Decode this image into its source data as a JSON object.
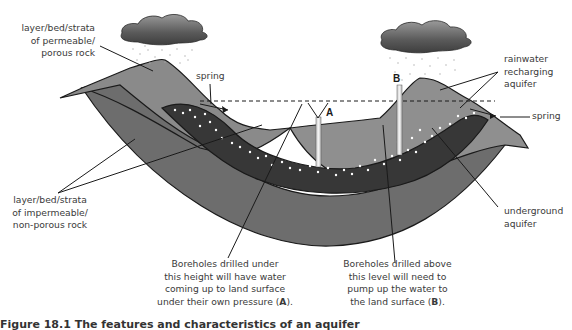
{
  "labels": {
    "permeable": [
      "layer/bed/strata",
      "of permeable/",
      "porous rock"
    ],
    "spring_left": "spring",
    "rainwater": [
      "rainwater",
      "recharging",
      "aquifer"
    ],
    "spring_right": "spring",
    "impermeable": [
      "layer/bed/strata",
      "of impermeable/",
      "non-porous rock"
    ],
    "underground": [
      "underground",
      "aquifer"
    ],
    "borehole_a_text": [
      "Boreholes drilled under",
      "this height will have water",
      "coming up to land surface",
      "under their own pressure ("
    ],
    "borehole_a_letter": "A",
    "borehole_b_text": [
      "Boreholes drilled above",
      "this level will need to",
      "pump up the water to",
      "the land surface ("
    ],
    "borehole_b_letter": "B",
    "close_paren": ").",
    "marker_a": "A",
    "marker_b": "B"
  },
  "caption": "Figure 18.1 The features and characteristics of an aquifer",
  "colors": {
    "impermeable_rock": "#6e6e6e",
    "permeable_rock": "#9a9a9a",
    "aquifer": "#3a3a3a",
    "cloud": "#7a7a7a",
    "line": "#1a1a1a"
  }
}
